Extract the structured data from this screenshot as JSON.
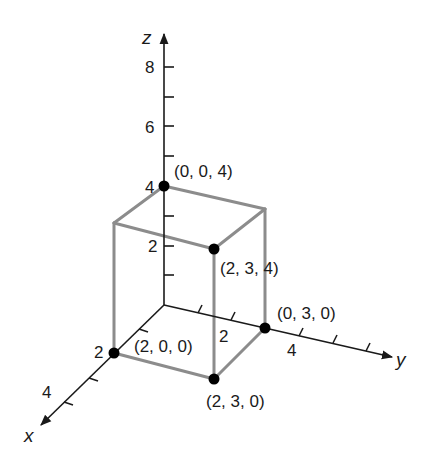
{
  "figure": {
    "type": "3d-coordinate-box",
    "axes": {
      "x": {
        "label": "x",
        "tick_labels": [
          "2",
          "4"
        ]
      },
      "y": {
        "label": "y",
        "tick_labels": [
          "2",
          "4"
        ]
      },
      "z": {
        "label": "z",
        "tick_labels": [
          "2",
          "4",
          "6",
          "8"
        ]
      }
    },
    "points": [
      {
        "label": "(0, 0, 4)"
      },
      {
        "label": "(2, 3, 4)"
      },
      {
        "label": "(0, 3, 0)"
      },
      {
        "label": "(2, 0, 0)"
      },
      {
        "label": "(2, 3, 0)"
      }
    ],
    "colors": {
      "axis": "#1a1a1a",
      "box": "#8c8c8c",
      "point": "#000000"
    }
  }
}
